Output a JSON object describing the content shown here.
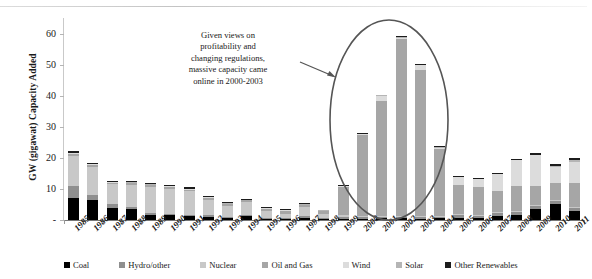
{
  "chart_data": {
    "type": "bar",
    "title": "",
    "subtype": "stacked-bar",
    "xlabel": "",
    "ylabel": "GW (gigawat) Capacity Added",
    "ylim": [
      0,
      65
    ],
    "yticks": [
      "-",
      "10",
      "20",
      "30",
      "40",
      "50",
      "60"
    ],
    "ytick_values": [
      0,
      10,
      20,
      30,
      40,
      50,
      60
    ],
    "grid": false,
    "legend_position": "bottom",
    "categories": [
      "1985",
      "1986",
      "1987",
      "1988",
      "1989",
      "1990",
      "1991",
      "1992",
      "1993",
      "1994",
      "1995",
      "1996",
      "1997",
      "1998",
      "1999",
      "2000",
      "2001",
      "2002",
      "2003",
      "2004",
      "2005",
      "2006",
      "2007",
      "2008",
      "2009",
      "2010",
      "2011"
    ],
    "series": [
      {
        "name": "Coal",
        "color": "#000000",
        "values": [
          7.0,
          6.5,
          4.0,
          3.5,
          1.5,
          1.5,
          1.3,
          1.0,
          0.6,
          1.2,
          0.4,
          0.3,
          0.7,
          0.2,
          0.4,
          0.4,
          0.5,
          0.5,
          0.4,
          0.5,
          0.8,
          0.6,
          1.4,
          1.5,
          3.5,
          5.0,
          3.0
        ]
      },
      {
        "name": "Hydro/other",
        "color": "#8f8f8f",
        "values": [
          4.0,
          1.5,
          1.0,
          0.8,
          0.6,
          0.5,
          0.4,
          0.5,
          0.4,
          0.5,
          0.4,
          0.3,
          0.5,
          0.3,
          0.5,
          0.5,
          0.5,
          0.5,
          0.5,
          0.6,
          0.8,
          0.8,
          0.8,
          1.0,
          1.0,
          1.0,
          1.0
        ]
      },
      {
        "name": "Nuclear",
        "color": "#c8c8c8",
        "values": [
          9.5,
          9.0,
          6.5,
          7.0,
          8.5,
          8.0,
          7.5,
          5.0,
          3.5,
          4.0,
          2.0,
          1.5,
          3.0,
          1.5,
          0.6,
          0.4,
          0.3,
          0.3,
          0.3,
          0.3,
          0.3,
          0.3,
          0.3,
          0.3,
          0.3,
          0.3,
          0.3
        ]
      },
      {
        "name": "Oil and Gas",
        "color": "#a6a6a6",
        "values": [
          0.8,
          0.7,
          0.5,
          0.5,
          0.6,
          0.6,
          0.6,
          0.6,
          0.6,
          0.6,
          0.8,
          0.8,
          0.6,
          0.8,
          9.0,
          26.0,
          37.0,
          57.0,
          47.0,
          21.5,
          9.5,
          9.0,
          7.0,
          8.0,
          6.0,
          5.5,
          7.5
        ]
      },
      {
        "name": "Wind",
        "color": "#dcdcdc",
        "values": [
          0.3,
          0.2,
          0.2,
          0.2,
          0.2,
          0.2,
          0.2,
          0.2,
          0.2,
          0.2,
          0.2,
          0.2,
          0.2,
          0.2,
          0.3,
          0.4,
          1.7,
          0.4,
          1.7,
          0.4,
          2.4,
          2.5,
          5.3,
          8.4,
          10.0,
          5.2,
          6.8
        ]
      },
      {
        "name": "Solar",
        "color": "#b5b5b5",
        "values": [
          0.1,
          0.1,
          0.1,
          0.1,
          0.1,
          0.1,
          0.1,
          0.1,
          0.1,
          0.1,
          0.1,
          0.1,
          0.1,
          0.1,
          0.1,
          0.1,
          0.1,
          0.1,
          0.1,
          0.1,
          0.1,
          0.1,
          0.1,
          0.1,
          0.2,
          0.4,
          0.8
        ]
      },
      {
        "name": "Other Renewables",
        "color": "#1c1c1c",
        "values": [
          0.6,
          0.5,
          0.4,
          0.4,
          0.4,
          0.4,
          0.4,
          0.3,
          0.3,
          0.3,
          0.3,
          0.3,
          0.3,
          0.2,
          0.3,
          0.3,
          0.3,
          0.3,
          0.3,
          0.3,
          0.3,
          0.3,
          0.4,
          0.4,
          0.5,
          0.5,
          0.6
        ]
      }
    ],
    "totals": [
      22.3,
      18.5,
      12.7,
      12.5,
      11.9,
      11.3,
      10.5,
      7.7,
      5.7,
      6.9,
      4.2,
      3.5,
      5.4,
      3.3,
      11.2,
      28.1,
      40.4,
      59.1,
      50.3,
      23.7,
      14.2,
      13.6,
      15.3,
      19.7,
      21.5,
      17.9,
      20.0
    ],
    "annotations": [
      {
        "name": "capacity-callout",
        "lines": [
          "Given views on",
          "profitability and",
          "changing regulations,",
          "massive capacity came",
          "online in 2000-2003"
        ],
        "has_arrow": true,
        "has_ellipse": true,
        "ellipse_years": [
          "1999",
          "2000",
          "2001",
          "2002",
          "2003",
          "2004"
        ]
      }
    ]
  },
  "legend": {
    "items": [
      {
        "label": "Coal",
        "color": "#000000"
      },
      {
        "label": "Hydro/other",
        "color": "#8f8f8f"
      },
      {
        "label": "Nuclear",
        "color": "#c8c8c8"
      },
      {
        "label": "Oil and Gas",
        "color": "#a6a6a6"
      },
      {
        "label": "Wind",
        "color": "#dcdcdc"
      },
      {
        "label": "Solar",
        "color": "#b5b5b5"
      },
      {
        "label": "Other Renewables",
        "color": "#1c1c1c"
      }
    ]
  },
  "colors": {
    "axis": "#777777",
    "tick": "#b4b4b4",
    "ellipse": "#555555",
    "arrow": "#555555",
    "background": "#ffffff"
  }
}
